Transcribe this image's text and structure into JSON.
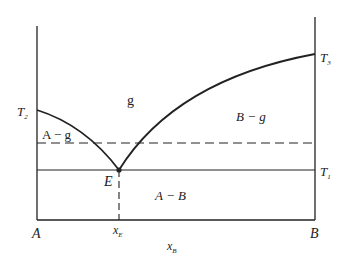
{
  "diagram": {
    "type": "binary eutectic phase diagram",
    "axis_labels": {
      "left": "A",
      "right": "B",
      "x_axis": "x",
      "x_axis_sub": "B",
      "eutectic_composition": "x",
      "eutectic_composition_sub": "E"
    },
    "temperatures": {
      "t1": {
        "main": "T",
        "sub": "1"
      },
      "t2": {
        "main": "T",
        "sub": "2"
      },
      "t3": {
        "main": "T",
        "sub": "3"
      }
    },
    "regions": {
      "gas": "g",
      "a_gas": "A − g",
      "b_gas": "B − g",
      "a_b": "A − B"
    },
    "points": {
      "eutectic": "E"
    },
    "colors": {
      "line": "#222222",
      "background": "#ffffff"
    }
  }
}
